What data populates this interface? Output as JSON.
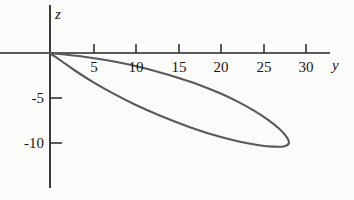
{
  "figure": {
    "background_color": "#fbfbfa",
    "axis_color": "#262626",
    "curve_color": "#595959"
  },
  "axes": {
    "horizontal": {
      "name": "y",
      "label": "y",
      "label_style": "italic"
    },
    "vertical": {
      "name": "z",
      "label": "z",
      "label_style": "italic"
    }
  },
  "chart_data": {
    "type": "line",
    "title": "",
    "subtitle": "",
    "xlabel": "y",
    "ylabel": "z",
    "xlim": [
      -1.2,
      35.5
    ],
    "ylim": [
      -15.5,
      5.5
    ],
    "xticks": [
      5,
      10,
      15,
      20,
      25,
      30
    ],
    "xtick_labels": [
      "5",
      "10",
      "15",
      "20",
      "25",
      "30"
    ],
    "yticks": [
      -5,
      -10
    ],
    "ytick_labels": [
      "-5",
      "-10"
    ],
    "grid": false,
    "legend": null,
    "annotations": [],
    "series": [
      {
        "name": "closed orbit",
        "closed": true,
        "description": "thin elongated loop from origin to (28, -10)",
        "points": [
          [
            0.0,
            0.0
          ],
          [
            1.2,
            -0.12
          ],
          [
            3.0,
            -0.3
          ],
          [
            5.0,
            -0.55
          ],
          [
            7.5,
            -0.95
          ],
          [
            10.0,
            -1.45
          ],
          [
            12.5,
            -2.05
          ],
          [
            15.0,
            -2.75
          ],
          [
            17.5,
            -3.55
          ],
          [
            20.0,
            -4.5
          ],
          [
            22.0,
            -5.4
          ],
          [
            24.0,
            -6.45
          ],
          [
            25.6,
            -7.45
          ],
          [
            26.9,
            -8.45
          ],
          [
            27.7,
            -9.3
          ],
          [
            28.0,
            -10.0
          ],
          [
            27.5,
            -10.35
          ],
          [
            26.2,
            -10.4
          ],
          [
            24.5,
            -10.25
          ],
          [
            22.0,
            -9.8
          ],
          [
            19.0,
            -9.05
          ],
          [
            16.0,
            -8.1
          ],
          [
            13.0,
            -7.0
          ],
          [
            10.0,
            -5.75
          ],
          [
            7.5,
            -4.55
          ],
          [
            5.0,
            -3.2
          ],
          [
            3.0,
            -2.0
          ],
          [
            1.5,
            -1.0
          ],
          [
            0.6,
            -0.4
          ],
          [
            0.0,
            0.0
          ]
        ]
      }
    ]
  }
}
